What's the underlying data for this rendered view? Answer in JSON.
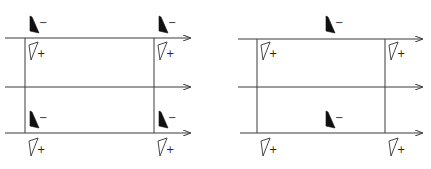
{
  "colors": {
    "line": "#3a3a3a",
    "filled": "#111111",
    "outline": "#333333",
    "background": "#ffffff"
  },
  "signs": {
    "minus": "−",
    "plus": "+"
  },
  "panels": [
    {
      "name": "left-panel",
      "hlines": [
        {
          "x1": 5,
          "x2": 190,
          "y": 38
        },
        {
          "x1": 5,
          "x2": 190,
          "y": 87
        },
        {
          "x1": 5,
          "x2": 190,
          "y": 133
        }
      ],
      "vlines": [
        {
          "x": 25,
          "y1": 38,
          "y2": 133
        },
        {
          "x": 154,
          "y1": 38,
          "y2": 133
        }
      ],
      "filled_markers": [
        {
          "x": 30,
          "y": 33,
          "label": "minus"
        },
        {
          "x": 159,
          "y": 33,
          "label": "minus"
        },
        {
          "x": 30,
          "y": 128,
          "label": "minus"
        },
        {
          "x": 159,
          "y": 128,
          "label": "minus"
        }
      ],
      "outline_markers": [
        {
          "x": 29,
          "y": 42,
          "label": "plus"
        },
        {
          "x": 158,
          "y": 42,
          "label": "plus"
        },
        {
          "x": 29,
          "y": 138,
          "label": "plus"
        },
        {
          "x": 158,
          "y": 138,
          "label": "plus"
        }
      ]
    },
    {
      "name": "right-panel",
      "hlines": [
        {
          "x1": 238,
          "x2": 422,
          "y": 39
        },
        {
          "x1": 238,
          "x2": 422,
          "y": 87
        },
        {
          "x1": 240,
          "x2": 422,
          "y": 133
        }
      ],
      "vlines": [
        {
          "x": 257,
          "y1": 39,
          "y2": 133
        },
        {
          "x": 385,
          "y1": 39,
          "y2": 133
        }
      ],
      "filled_markers": [
        {
          "x": 326,
          "y": 33,
          "label": "minus"
        },
        {
          "x": 326,
          "y": 128,
          "label": "minus"
        }
      ],
      "outline_markers": [
        {
          "x": 261,
          "y": 42,
          "label": "plus"
        },
        {
          "x": 389,
          "y": 42,
          "label": "plus"
        },
        {
          "x": 261,
          "y": 138,
          "label": "plus"
        },
        {
          "x": 389,
          "y": 138,
          "label": "plus"
        }
      ]
    }
  ]
}
